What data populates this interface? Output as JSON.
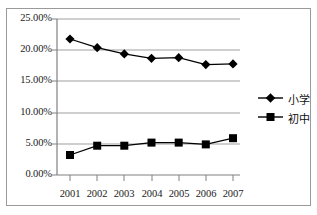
{
  "chart_data": {
    "type": "line",
    "title": "",
    "subtitle": "",
    "xlabel": "",
    "ylabel": "",
    "categories": [
      "2001",
      "2002",
      "2003",
      "2004",
      "2005",
      "2006",
      "2007"
    ],
    "series": [
      {
        "name": "小学",
        "marker": "diamond",
        "color": "#000000",
        "values": [
          21.8,
          20.4,
          19.4,
          18.7,
          18.8,
          17.7,
          17.8
        ]
      },
      {
        "name": "初中",
        "marker": "square",
        "color": "#000000",
        "values": [
          3.2,
          4.7,
          4.7,
          5.2,
          5.2,
          4.9,
          5.9
        ]
      }
    ],
    "ylim": [
      0,
      25
    ],
    "ytick_values": [
      0,
      5,
      10,
      15,
      20,
      25
    ],
    "ytick_labels": [
      "0.00%",
      "5.00%",
      "10.00%",
      "15.00%",
      "20.00%",
      "25.00%"
    ],
    "grid": true,
    "grid_axis": "y",
    "legend_position": "right",
    "value_suffix": "%"
  },
  "axes": {
    "y_ticks": [
      {
        "label": "25.00%",
        "value": 25
      },
      {
        "label": "20.00%",
        "value": 20
      },
      {
        "label": "15.00%",
        "value": 15
      },
      {
        "label": "10.00%",
        "value": 10
      },
      {
        "label": "5.00%",
        "value": 5
      },
      {
        "label": "0.00%",
        "value": 0
      }
    ],
    "x_ticks": [
      {
        "label": "2001"
      },
      {
        "label": "2002"
      },
      {
        "label": "2003"
      },
      {
        "label": "2004"
      },
      {
        "label": "2005"
      },
      {
        "label": "2006"
      },
      {
        "label": "2007"
      }
    ]
  },
  "legend": {
    "entries": [
      {
        "label": "小学",
        "marker": "diamond-marker-icon"
      },
      {
        "label": "初中",
        "marker": "square-marker-icon"
      }
    ]
  },
  "colors": {
    "series_line": "#000000",
    "gridline": "#9f9f9f",
    "axis": "#808080",
    "frame": "#9a9a9a",
    "text": "#1a1a1a",
    "background": "#ffffff"
  }
}
